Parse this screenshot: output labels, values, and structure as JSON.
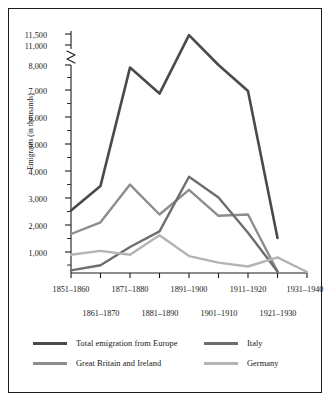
{
  "chart_data": {
    "type": "line",
    "title": "",
    "xlabel": "",
    "ylabel": "Emigrants (in thousands)",
    "grid": false,
    "legend_position": "bottom",
    "axis_break": {
      "present": true,
      "between": [
        8000,
        11000
      ],
      "note": "zigzag break on y-axis between 8,000 and 11,000"
    },
    "ylim": [
      0,
      11500
    ],
    "y_ticks_labeled": [
      "1,000",
      "2,000",
      "3,000",
      "4,000",
      "5,000",
      "6,000",
      "7,000",
      "8,000",
      "11,000",
      "11,500"
    ],
    "y_tick_values": [
      1000,
      2000,
      3000,
      4000,
      5000,
      6000,
      7000,
      8000,
      11000,
      11500
    ],
    "y_minor_tick_step": 500,
    "categories": [
      "1851–1860",
      "1861–1870",
      "1871–1880",
      "1881–1890",
      "1891–1900",
      "1901–1910",
      "1911–1920",
      "1921–1930",
      "1931–1940"
    ],
    "x_tick_labels_row_top": [
      "1851–1860",
      "1871–1880",
      "1891–1900",
      "1911–1920",
      "1931–1940"
    ],
    "x_tick_labels_row_bottom": [
      "1861–1870",
      "1881–1890",
      "1901–1910",
      "1921–1930"
    ],
    "series": [
      {
        "name": "Total emigration from Europe",
        "color": "#4a4a4a",
        "width": 2.6,
        "values": [
          2400,
          3350,
          7900,
          6900,
          11450,
          8000,
          7000,
          1350,
          null
        ],
        "values_note": "last plotted point is at 1921–1930 = 1,350; series drawn through 1921–1930"
      },
      {
        "name": "Great Britain and Ireland",
        "color": "#8d8d8d",
        "width": 2.4,
        "values": [
          1500,
          1950,
          3400,
          2250,
          3200,
          2200,
          2250,
          60,
          null
        ]
      },
      {
        "name": "Italy",
        "color": "#6e6e6e",
        "width": 2.4,
        "values": [
          100,
          300,
          1000,
          1600,
          3700,
          2900,
          1550,
          60,
          null
        ]
      },
      {
        "name": "Germany",
        "color": "#b4b4b4",
        "width": 2.4,
        "values": [
          700,
          850,
          700,
          1450,
          650,
          400,
          250,
          600,
          40
        ]
      }
    ]
  },
  "axis": {
    "y_title": "Emigrants (in thousands)",
    "y_labels": [
      "11,500",
      "11,000",
      "8,000",
      "7,000",
      "6,000",
      "5,000",
      "4,000",
      "3,000",
      "2,000",
      "1,000"
    ],
    "x_labels_top": [
      "1851–1860",
      "1871–1880",
      "1891–1900",
      "1911–1920",
      "1931–1940"
    ],
    "x_labels_bottom": [
      "1861–1870",
      "1881–1890",
      "1901–1910",
      "1921–1930"
    ]
  },
  "legend": {
    "items": [
      {
        "label": "Total emigration from Europe",
        "color": "#4a4a4a"
      },
      {
        "label": "Italy",
        "color": "#6e6e6e"
      },
      {
        "label": "Great Britain and Ireland",
        "color": "#8d8d8d"
      },
      {
        "label": "Germany",
        "color": "#b4b4b4"
      }
    ]
  },
  "colors": {
    "frame": "#1c1c1c",
    "axis": "#1a1a1a",
    "text": "#161616",
    "background": "#ffffff"
  }
}
